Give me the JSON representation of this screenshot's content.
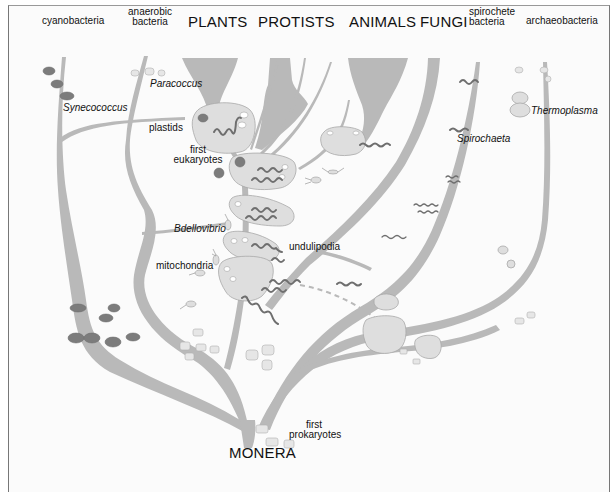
{
  "diagram": {
    "kingdoms": {
      "plants": "PLANTS",
      "protists": "PROTISTS",
      "animals": "ANIMALS",
      "fungi": "FUNGI",
      "monera": "MONERA"
    },
    "bacteria_labels": {
      "cyanobacteria": "cyanobacteria",
      "anaerobic_1": "anaerobic",
      "anaerobic_2": "bacteria",
      "spirochete_1": "spirochete",
      "spirochete_2": "bacteria",
      "archaeobacteria": "archaeobacteria"
    },
    "organisms": {
      "paracoccus": "Paracoccus",
      "synecococcus": "Synecococcus",
      "thermoplasma": "Thermoplasma",
      "spirochaeta": "Spirochaeta",
      "bdellovibrio": "Bdellovibrio"
    },
    "annotations": {
      "plastids": "plastids",
      "first_eukaryotes_1": "first",
      "first_eukaryotes_2": "eukaryotes",
      "undulipodia": "undulipodia",
      "mitochondria": "mitochondria",
      "first_prokaryotes_1": "first",
      "first_prokaryotes_2": "prokaryotes"
    },
    "colors": {
      "branch": "#b9b9b9",
      "cell_fill": "#dedede",
      "cyano_cell": "#7c7c7c",
      "spirochete": "#6e6e6e",
      "text": "#111111"
    }
  }
}
